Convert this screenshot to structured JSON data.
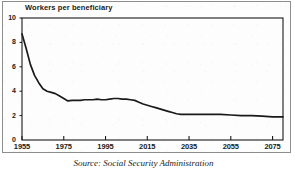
{
  "figure": {
    "title": "Workers per beneficiary",
    "source_caption": "Source: Social Security Administration"
  },
  "chart_data": {
    "type": "line",
    "title": "Workers per beneficiary",
    "subtitle": "",
    "xlabel": "",
    "ylabel": "",
    "xlim": [
      1955,
      2080
    ],
    "ylim": [
      0,
      10
    ],
    "grid": false,
    "legend": "none",
    "line_color": "#1a1a1a",
    "xticks": [
      1955,
      1975,
      1995,
      2015,
      2035,
      2055,
      2075
    ],
    "xtick_labels": [
      "1955",
      "1975",
      "1995",
      "2015",
      "2035",
      "2055",
      "2075"
    ],
    "yticks": [
      0,
      2,
      4,
      6,
      8,
      10
    ],
    "ytick_labels": [
      "0",
      "2",
      "4",
      "6",
      "8",
      "10"
    ],
    "series": [
      {
        "name": "Workers per beneficiary",
        "x": [
          1955,
          1957,
          1959,
          1961,
          1963,
          1965,
          1967,
          1969,
          1971,
          1973,
          1975,
          1977,
          1979,
          1981,
          1983,
          1985,
          1987,
          1989,
          1991,
          1993,
          1995,
          1997,
          1999,
          2001,
          2003,
          2005,
          2007,
          2009,
          2011,
          2013,
          2015,
          2017,
          2019,
          2021,
          2023,
          2025,
          2027,
          2029,
          2031,
          2033,
          2035,
          2040,
          2045,
          2050,
          2055,
          2060,
          2065,
          2070,
          2075,
          2080
        ],
        "values": [
          8.7,
          7.5,
          6.2,
          5.3,
          4.7,
          4.2,
          4.0,
          3.9,
          3.8,
          3.6,
          3.4,
          3.2,
          3.25,
          3.25,
          3.25,
          3.3,
          3.3,
          3.3,
          3.35,
          3.3,
          3.3,
          3.35,
          3.4,
          3.4,
          3.35,
          3.35,
          3.3,
          3.25,
          3.1,
          2.95,
          2.85,
          2.75,
          2.65,
          2.55,
          2.45,
          2.35,
          2.25,
          2.15,
          2.1,
          2.1,
          2.1,
          2.1,
          2.1,
          2.1,
          2.05,
          2.0,
          2.0,
          1.95,
          1.9,
          1.9
        ]
      }
    ],
    "annotations": []
  }
}
